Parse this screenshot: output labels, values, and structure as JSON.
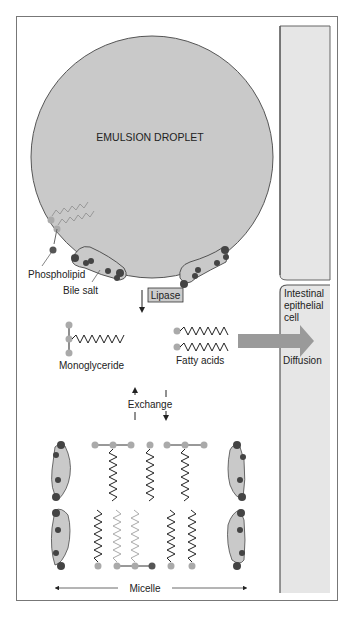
{
  "diagram": {
    "droplet_label": "EMULSION DROPLET",
    "phospholipid_label": "Phospholipid",
    "bile_salt_label": "Bile salt",
    "enzyme_label": "Lipase",
    "monoglyceride_label": "Monoglyceride",
    "fatty_acids_label": "Fatty acids",
    "cell_label_1": "Intestinal",
    "cell_label_2": "epithelial",
    "cell_label_3": "cell",
    "diffusion_label": "Diffusion",
    "exchange_label": "Exchange",
    "micelle_label": "Micelle"
  },
  "colors": {
    "droplet": "#c9c9c9",
    "cell": "#e6e6e6",
    "arrow": "#9a9a9a",
    "head_light": "#a8a8a8",
    "head_dark": "#555555",
    "frame": "#777777"
  }
}
